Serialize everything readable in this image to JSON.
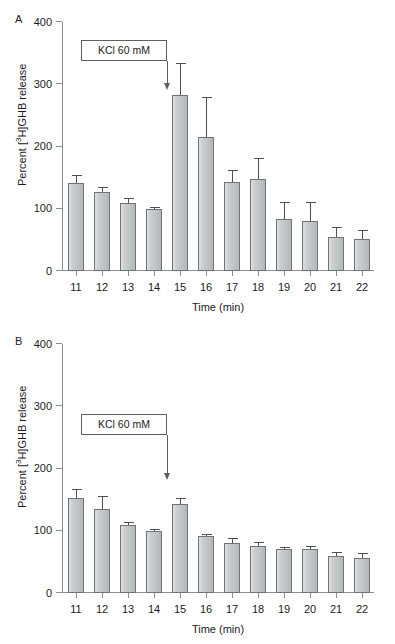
{
  "figure": {
    "background": "#ffffff",
    "bar_fill": "#c6cbce",
    "bar_stroke": "#6f7478",
    "axis_color": "#8b8f92"
  },
  "panels": [
    {
      "letter": "A",
      "annotation": {
        "label": "KCl 60 mM",
        "arrow_at_time": 14.5
      },
      "chart_data": {
        "type": "bar",
        "title": "",
        "xlabel": "Time (min)",
        "ylabel": "Percent [3H]GHB release",
        "ylabel_html": "Percent [<sup>3</sup>H]GHB release",
        "ylim": [
          0,
          400
        ],
        "yticks": [
          0,
          100,
          200,
          300,
          400
        ],
        "grid": false,
        "legend": "none",
        "categories": [
          "11",
          "12",
          "13",
          "14",
          "15",
          "16",
          "17",
          "18",
          "19",
          "20",
          "21",
          "22"
        ],
        "values": [
          142,
          127,
          110,
          100,
          283,
          216,
          143,
          148,
          83,
          80,
          54,
          52
        ],
        "errors": [
          10,
          7,
          5,
          2,
          50,
          62,
          17,
          32,
          27,
          29,
          15,
          13
        ],
        "error_type": "sem"
      }
    },
    {
      "letter": "B",
      "annotation": {
        "label": "KCl 60 mM",
        "arrow_at_time": 14.5
      },
      "chart_data": {
        "type": "bar",
        "title": "",
        "xlabel": "Time (min)",
        "ylabel": "Percent [3H]GHB release",
        "ylabel_html": "Percent [<sup>3</sup>H]GHB release",
        "ylim": [
          0,
          400
        ],
        "yticks": [
          0,
          100,
          200,
          300,
          400
        ],
        "grid": false,
        "legend": "none",
        "categories": [
          "11",
          "12",
          "13",
          "14",
          "15",
          "16",
          "17",
          "18",
          "19",
          "20",
          "21",
          "22"
        ],
        "values": [
          152,
          135,
          109,
          100,
          143,
          91,
          80,
          76,
          70,
          71,
          59,
          57
        ],
        "errors": [
          14,
          19,
          3,
          2,
          8,
          2,
          7,
          5,
          2,
          3,
          6,
          6
        ],
        "error_type": "sem"
      }
    }
  ]
}
